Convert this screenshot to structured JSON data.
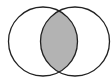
{
  "diagram": {
    "type": "venn",
    "sets": [
      {
        "id": "A",
        "cx": 43,
        "cy": 41.5,
        "r": 34.5
      },
      {
        "id": "B",
        "cx": 75,
        "cy": 41.5,
        "r": 34.5
      }
    ],
    "highlighted_region": "A∩B",
    "colors": {
      "background": "#ffffff",
      "stroke": "#222222",
      "intersection_fill": "#b3b3b3",
      "outside_fill": "#ffffff"
    },
    "stroke_width": 1.3
  }
}
